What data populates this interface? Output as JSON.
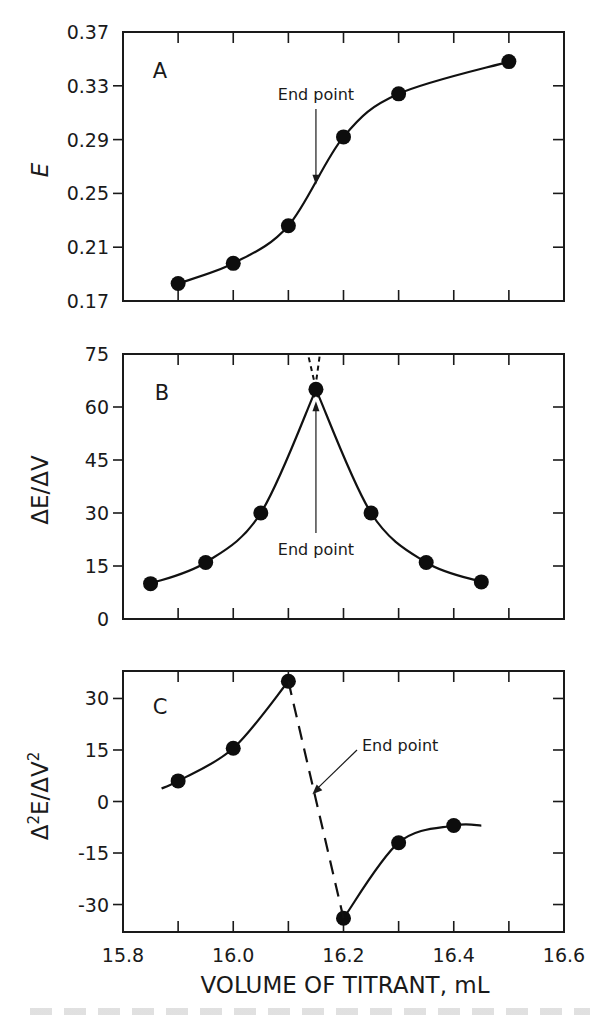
{
  "chart_data": [
    {
      "type": "line",
      "panel": "A",
      "title": "",
      "xlabel": "VOLUME OF TITRANT, mL",
      "ylabel": "E",
      "xlim": [
        15.8,
        16.6
      ],
      "ylim": [
        0.17,
        0.37
      ],
      "yticks": [
        "0.17",
        "0.21",
        "0.25",
        "0.29",
        "0.33",
        "0.37"
      ],
      "ytick_values": [
        0.17,
        0.21,
        0.25,
        0.29,
        0.33,
        0.37
      ],
      "xtick_values": [
        15.9,
        16.0,
        16.1,
        16.2,
        16.3,
        16.4,
        16.5
      ],
      "series": [
        {
          "name": "E vs volume",
          "x": [
            15.9,
            16.0,
            16.1,
            16.2,
            16.3,
            16.5
          ],
          "y": [
            0.183,
            0.198,
            0.226,
            0.292,
            0.324,
            0.348
          ],
          "markers": true,
          "smooth": true
        }
      ],
      "annotations": [
        {
          "text": "End point",
          "x": 16.15,
          "y": 0.255,
          "type": "arrow-down"
        }
      ],
      "grid": false
    },
    {
      "type": "line",
      "panel": "B",
      "title": "",
      "xlabel": "VOLUME OF TITRANT, mL",
      "ylabel": "ΔE/ΔV",
      "xlim": [
        15.8,
        16.6
      ],
      "ylim": [
        0,
        75
      ],
      "yticks": [
        "0",
        "15",
        "30",
        "45",
        "60",
        "75"
      ],
      "ytick_values": [
        0,
        15,
        30,
        45,
        60,
        75
      ],
      "xtick_values": [
        15.9,
        16.0,
        16.1,
        16.2,
        16.3,
        16.4,
        16.5
      ],
      "series": [
        {
          "name": "first derivative",
          "x": [
            15.85,
            15.95,
            16.05,
            16.15,
            16.25,
            16.35,
            16.45
          ],
          "y": [
            10,
            16,
            30,
            65,
            30,
            16,
            10.5
          ],
          "markers": true,
          "smooth": true
        }
      ],
      "extrapolation": {
        "style": "dashed",
        "peak_x": 16.15,
        "to_y": 75
      },
      "annotations": [
        {
          "text": "End point",
          "x": 16.15,
          "y": 65,
          "type": "arrow-up"
        }
      ],
      "grid": false
    },
    {
      "type": "line",
      "panel": "C",
      "title": "",
      "xlabel": "VOLUME OF TITRANT, mL",
      "ylabel": "Δ²E/ΔV²",
      "xlim": [
        15.8,
        16.6
      ],
      "ylim": [
        -38,
        38
      ],
      "yticks": [
        "30",
        "15",
        "0",
        "-15",
        "-30"
      ],
      "ytick_values": [
        30,
        15,
        0,
        -15,
        -30
      ],
      "xticks": [
        "15.8",
        "16.0",
        "16.2",
        "16.4",
        "16.6"
      ],
      "xtick_label_values": [
        15.8,
        16.0,
        16.2,
        16.4,
        16.6
      ],
      "xtick_values": [
        15.9,
        16.0,
        16.1,
        16.2,
        16.3,
        16.4,
        16.5
      ],
      "series": [
        {
          "name": "second derivative (left branch)",
          "x": [
            15.9,
            16.0,
            16.1
          ],
          "y": [
            6,
            15.5,
            35
          ],
          "markers": true,
          "smooth": true,
          "curve_start": [
            15.87,
            3.8
          ]
        },
        {
          "name": "second derivative (right branch)",
          "x": [
            16.2,
            16.3,
            16.4
          ],
          "y": [
            -34,
            -12,
            -7
          ],
          "markers": true,
          "smooth": true,
          "curve_end": [
            16.45,
            -7
          ]
        },
        {
          "name": "zero-crossing connector",
          "x": [
            16.1,
            16.2
          ],
          "y": [
            35,
            -34
          ],
          "style": "dashed"
        }
      ],
      "annotations": [
        {
          "text": "End point",
          "x": 16.14,
          "y": 1.5,
          "type": "arrow-diagonal"
        }
      ],
      "grid": false
    }
  ],
  "labels": {
    "panel_a": "A",
    "panel_b": "B",
    "panel_c": "C",
    "end_point": "End point",
    "x_axis_title": "VOLUME OF TITRANT, mL",
    "y_title_a": "E",
    "y_title_b": "ΔE/ΔV",
    "y_title_c_base": "Δ",
    "y_title_c_sup1": "2",
    "y_title_c_mid": "E/ΔV",
    "y_title_c_sup2": "2"
  }
}
